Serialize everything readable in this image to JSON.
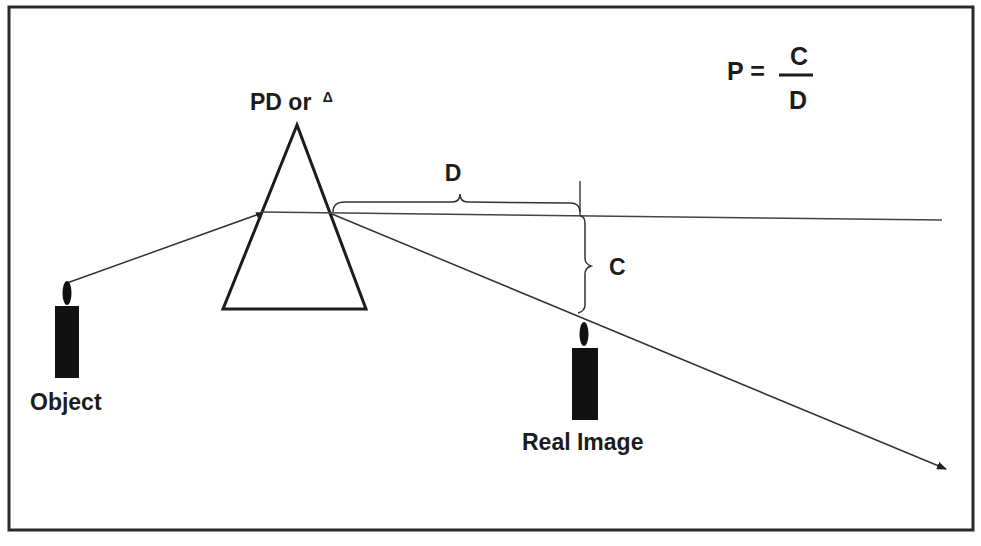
{
  "diagram": {
    "type": "optics-prism-deviation",
    "formula": {
      "lhs": "P =",
      "numerator": "C",
      "denominator": "D"
    },
    "prism_label": {
      "text": "PD or",
      "symbol": "Δ"
    },
    "distance_label": "D",
    "displacement_label": "C",
    "object_label": "Object",
    "image_label": "Real Image",
    "colors": {
      "ink": "#1c1c1c",
      "line": "#333333",
      "background": "#ffffff"
    }
  }
}
